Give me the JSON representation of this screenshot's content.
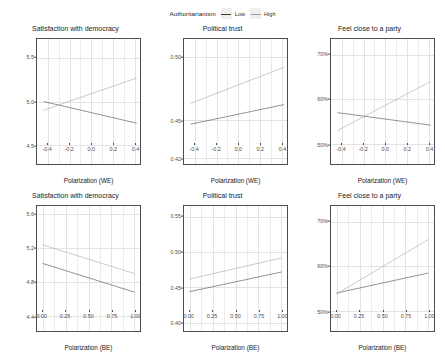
{
  "legend": {
    "title": "Authoritarianism",
    "items": [
      {
        "label": "Low",
        "color": "#3a3a3a"
      },
      {
        "label": "High",
        "color": "#9e9e9e"
      }
    ]
  },
  "chart_data": [
    {
      "type": "line",
      "title": "Satisfaction with democracy",
      "xlabel": "Polarization (WE)",
      "ylabel": "",
      "xlim": [
        -0.5,
        0.45
      ],
      "ylim": [
        4.28,
        5.72
      ],
      "xticks": [
        -0.4,
        -0.2,
        0.0,
        0.2,
        0.4
      ],
      "xticklabels": [
        "-0.4",
        "-0.2",
        "0.0",
        "0.2",
        "0.4"
      ],
      "yticks": [
        4.5,
        5.0,
        5.5
      ],
      "yticklabels": [
        "4.5",
        "5.0",
        "5.5"
      ],
      "grid": true,
      "series": [
        {
          "name": "Low",
          "color": "#3a3a3a",
          "x": [
            -0.44,
            0.42
          ],
          "y": [
            5.0,
            4.75
          ]
        },
        {
          "name": "High",
          "color": "#9e9e9e",
          "x": [
            -0.44,
            0.42
          ],
          "y": [
            4.9,
            5.27
          ]
        }
      ]
    },
    {
      "type": "line",
      "title": "Political trust",
      "xlabel": "Polarization (WE)",
      "ylabel": "",
      "xlim": [
        -0.5,
        0.45
      ],
      "ylim": [
        0.4155,
        0.5145
      ],
      "xticks": [
        -0.4,
        -0.2,
        0.0,
        0.2,
        0.4
      ],
      "xticklabels": [
        "-0.4",
        "-0.2",
        "0.0",
        "0.2",
        "0.4"
      ],
      "yticks": [
        0.42,
        0.45,
        0.5
      ],
      "yticklabels": [
        "0.42",
        "0.45",
        "0.50"
      ],
      "grid": true,
      "series": [
        {
          "name": "Low",
          "color": "#3a3a3a",
          "x": [
            -0.44,
            0.42
          ],
          "y": [
            0.447,
            0.4625
          ]
        },
        {
          "name": "High",
          "color": "#9e9e9e",
          "x": [
            -0.44,
            0.42
          ],
          "y": [
            0.4635,
            0.492
          ]
        }
      ]
    },
    {
      "type": "line",
      "title": "Feel close to a party",
      "xlabel": "Polarization (WE)",
      "ylabel": "",
      "xlim": [
        -0.5,
        0.45
      ],
      "ylim": [
        45.5,
        73.5
      ],
      "xticks": [
        -0.4,
        -0.2,
        0.0,
        0.2,
        0.4
      ],
      "xticklabels": [
        "-0.4",
        "-0.2",
        "0.0",
        "0.2",
        "0.4"
      ],
      "yticks": [
        50,
        60,
        70
      ],
      "yticklabels": [
        "50%",
        "60%",
        "70%"
      ],
      "grid": true,
      "series": [
        {
          "name": "Low",
          "color": "#3a3a3a",
          "x": [
            -0.44,
            0.42
          ],
          "y": [
            57.0,
            54.2
          ]
        },
        {
          "name": "High",
          "color": "#9e9e9e",
          "x": [
            -0.44,
            0.42
          ],
          "y": [
            53.0,
            64.0
          ]
        }
      ]
    },
    {
      "type": "line",
      "title": "Satisfaction with democracy",
      "xlabel": "Polarization (BE)",
      "ylabel": "",
      "xlim": [
        -0.06,
        1.06
      ],
      "ylim": [
        4.22,
        5.7
      ],
      "xticks": [
        0.0,
        0.25,
        0.5,
        0.75,
        1.0
      ],
      "xticklabels": [
        "0.00",
        "0.25",
        "0.50",
        "0.75",
        "1.00"
      ],
      "yticks": [
        4.4,
        4.8,
        5.2,
        5.6
      ],
      "yticklabels": [
        "4.4",
        "4.8",
        "5.2",
        "5.6"
      ],
      "grid": true,
      "series": [
        {
          "name": "Low",
          "color": "#3a3a3a",
          "x": [
            0.0,
            1.0
          ],
          "y": [
            5.02,
            4.68
          ]
        },
        {
          "name": "High",
          "color": "#9e9e9e",
          "x": [
            0.0,
            1.0
          ],
          "y": [
            5.24,
            4.9
          ]
        }
      ]
    },
    {
      "type": "line",
      "title": "Political trust",
      "xlabel": "Polarization (BE)",
      "ylabel": "",
      "xlim": [
        -0.06,
        1.06
      ],
      "ylim": [
        0.388,
        0.566
      ],
      "xticks": [
        0.0,
        0.25,
        0.5,
        0.75,
        1.0
      ],
      "xticklabels": [
        "0.00",
        "0.25",
        "0.50",
        "0.75",
        "1.00"
      ],
      "yticks": [
        0.4,
        0.45,
        0.5,
        0.55
      ],
      "yticklabels": [
        "0.40",
        "0.45",
        "0.50",
        "0.55"
      ],
      "grid": true,
      "series": [
        {
          "name": "Low",
          "color": "#3a3a3a",
          "x": [
            0.0,
            1.0
          ],
          "y": [
            0.444,
            0.472
          ]
        },
        {
          "name": "High",
          "color": "#9e9e9e",
          "x": [
            0.0,
            1.0
          ],
          "y": [
            0.462,
            0.492
          ]
        }
      ]
    },
    {
      "type": "line",
      "title": "Feel close to a party",
      "xlabel": "Polarization (BE)",
      "ylabel": "",
      "xlim": [
        -0.06,
        1.06
      ],
      "ylim": [
        45.5,
        73.5
      ],
      "xticks": [
        0.0,
        0.25,
        0.5,
        0.75,
        1.0
      ],
      "xticklabels": [
        "0.00",
        "0.25",
        "0.50",
        "0.75",
        "1.00"
      ],
      "yticks": [
        50,
        60,
        70
      ],
      "yticklabels": [
        "50%",
        "60%",
        "70%"
      ],
      "grid": true,
      "series": [
        {
          "name": "Low",
          "color": "#3a3a3a",
          "x": [
            0.0,
            1.0
          ],
          "y": [
            54.0,
            58.5
          ]
        },
        {
          "name": "High",
          "color": "#9e9e9e",
          "x": [
            0.0,
            1.0
          ],
          "y": [
            53.8,
            66.0
          ]
        }
      ]
    }
  ]
}
